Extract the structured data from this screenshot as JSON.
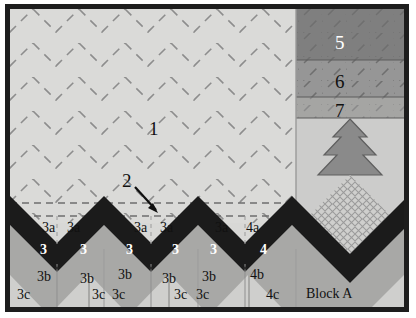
{
  "diagram": {
    "block_label": "Block A",
    "region_labels": {
      "background": "1",
      "callout": "2",
      "band_5": "5",
      "band_6": "6",
      "band_7": "7"
    },
    "zigzag_row_a": [
      "3a",
      "3a",
      "3a",
      "3a",
      "3a",
      "4a"
    ],
    "zigzag_row_main": [
      "3",
      "3",
      "3",
      "3",
      "3",
      "4"
    ],
    "zigzag_row_b": [
      "3b",
      "3b",
      "3b",
      "3b",
      "3b",
      "4b"
    ],
    "zigzag_row_c": [
      "3c",
      "3c",
      "3c",
      "3c",
      "3c",
      "4c"
    ],
    "colors": {
      "frame": "#1d1d1d",
      "background_light": "#d8d8d6",
      "zigzag_dark": "#1b1b1b",
      "mid_gray": "#a8a8a6",
      "light_gray": "#cfcfcd",
      "band_5": "#7f7f7f",
      "band_6": "#969696",
      "band_7": "#a8a8a6",
      "tree": "#8a8a8a",
      "quilt_line": "#8b8b8b",
      "arrow": "#101010"
    }
  }
}
